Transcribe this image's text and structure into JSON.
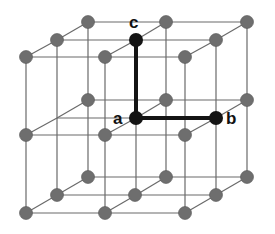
{
  "diagram": {
    "colors": {
      "line": "#6a6a6a",
      "atom": "#6e6e6e",
      "atom_highlight": "#141414",
      "bond": "#141414",
      "label": "#111111"
    },
    "labels": [
      {
        "id": "a",
        "text": "a",
        "x": 113,
        "y": 124
      },
      {
        "id": "b",
        "text": "b",
        "x": 226,
        "y": 124
      },
      {
        "id": "c",
        "text": "c",
        "x": 129,
        "y": 28
      }
    ],
    "atoms": [
      {
        "x": 88,
        "y": 22
      },
      {
        "x": 166,
        "y": 22
      },
      {
        "x": 247,
        "y": 22
      },
      {
        "x": 57,
        "y": 40
      },
      {
        "x": 216,
        "y": 40
      },
      {
        "x": 26,
        "y": 57
      },
      {
        "x": 105,
        "y": 57
      },
      {
        "x": 185,
        "y": 57
      },
      {
        "x": 88,
        "y": 100
      },
      {
        "x": 166,
        "y": 100
      },
      {
        "x": 247,
        "y": 100
      },
      {
        "x": 26,
        "y": 135
      },
      {
        "x": 105,
        "y": 135
      },
      {
        "x": 185,
        "y": 135
      },
      {
        "x": 88,
        "y": 177
      },
      {
        "x": 166,
        "y": 177
      },
      {
        "x": 247,
        "y": 177
      },
      {
        "x": 57,
        "y": 195
      },
      {
        "x": 135,
        "y": 195
      },
      {
        "x": 216,
        "y": 195
      },
      {
        "x": 26,
        "y": 213
      },
      {
        "x": 105,
        "y": 213
      },
      {
        "x": 185,
        "y": 213
      }
    ],
    "highlighted_atoms": [
      {
        "id": "a",
        "x": 136,
        "y": 118
      },
      {
        "id": "b",
        "x": 216,
        "y": 118
      },
      {
        "id": "c",
        "x": 136,
        "y": 40
      }
    ],
    "bonds": [
      {
        "from": "a",
        "to": "b"
      },
      {
        "from": "a",
        "to": "c"
      }
    ]
  }
}
